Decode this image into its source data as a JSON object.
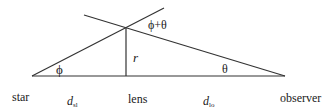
{
  "diagram": {
    "type": "gravitational-lensing-geometry",
    "labels": {
      "star": "star",
      "lens": "lens",
      "observer": "observer",
      "d_sl_main": "d",
      "d_sl_sub": "sl",
      "d_lo_main": "d",
      "d_lo_sub": "lo",
      "r": "r",
      "phi": "ϕ",
      "theta": "θ",
      "phi_plus_theta": "ϕ+θ"
    },
    "colors": {
      "line": "#333333",
      "text": "#1a1a1a",
      "background": "#ffffff"
    },
    "geometry": {
      "star": [
        32,
        76
      ],
      "lens_base": [
        126,
        76
      ],
      "lens_top": [
        126,
        28
      ],
      "observer": [
        285,
        76
      ]
    }
  }
}
